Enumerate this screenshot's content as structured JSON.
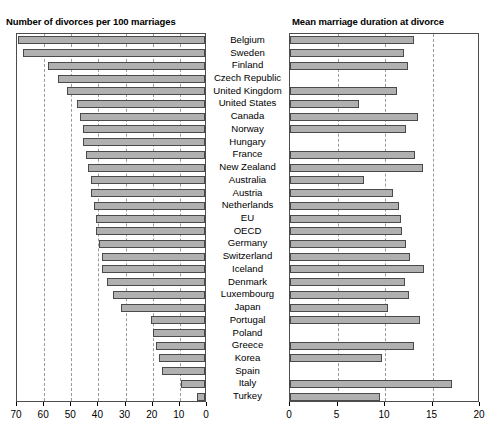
{
  "figure": {
    "countries": [
      "Belgium",
      "Sweden",
      "Finland",
      "Czech Republic",
      "United Kingdom",
      "United States",
      "Canada",
      "Norway",
      "Hungary",
      "France",
      "New Zealand",
      "Australia",
      "Austria",
      "Netherlands",
      "EU",
      "OECD",
      "Germany",
      "Switzerland",
      "Iceland",
      "Denmark",
      "Luxembourg",
      "Japan",
      "Portugal",
      "Poland",
      "Greece",
      "Korea",
      "Spain",
      "Italy",
      "Turkey"
    ]
  },
  "chart_data": [
    {
      "type": "bar",
      "orientation": "horizontal",
      "reversed_x": true,
      "title": "Number of divorces per 100 marriages",
      "xlabel": "",
      "ylabel": "",
      "xlim": [
        70,
        0
      ],
      "grid": true,
      "gridlines": [
        70,
        60,
        50,
        40,
        30,
        20,
        10,
        0
      ],
      "ticks": [
        "70",
        "60",
        "50",
        "40",
        "30",
        "20",
        "10",
        "0"
      ],
      "tick_values": [
        70,
        60,
        50,
        40,
        30,
        20,
        10,
        0
      ],
      "categories": [
        "Belgium",
        "Sweden",
        "Finland",
        "Czech Republic",
        "United Kingdom",
        "United States",
        "Canada",
        "Norway",
        "Hungary",
        "France",
        "New Zealand",
        "Australia",
        "Austria",
        "Netherlands",
        "EU",
        "OECD",
        "Germany",
        "Switzerland",
        "Iceland",
        "Denmark",
        "Luxembourg",
        "Japan",
        "Portugal",
        "Poland",
        "Greece",
        "Korea",
        "Spain",
        "Italy",
        "Turkey"
      ],
      "values": [
        69,
        67,
        58,
        54,
        51,
        47,
        46,
        46,
        46,
        45,
        45,
        44,
        43,
        42,
        42,
        41,
        40,
        40,
        39,
        38,
        38,
        36,
        34,
        31,
        29,
        25,
        20,
        19,
        19,
        17,
        17,
        16,
        9,
        3
      ],
      "bar_values": [
        69,
        67,
        58,
        54,
        51,
        47,
        46,
        45,
        45,
        44,
        43,
        42,
        42,
        41,
        40,
        40,
        39,
        38,
        38,
        36,
        34,
        31,
        20,
        19,
        18,
        17,
        16,
        9,
        3
      ]
    },
    {
      "type": "bar",
      "orientation": "horizontal",
      "reversed_x": false,
      "title": "Mean marriage duration at divorce",
      "xlabel": "",
      "ylabel": "",
      "xlim": [
        0,
        20
      ],
      "grid": true,
      "gridlines": [
        0,
        5,
        10,
        15,
        20
      ],
      "ticks": [
        "0",
        "5",
        "10",
        "15",
        "20"
      ],
      "tick_values": [
        0,
        5,
        10,
        15,
        20
      ],
      "categories": [
        "Belgium",
        "Sweden",
        "Finland",
        "Czech Republic",
        "United Kingdom",
        "United States",
        "Canada",
        "Norway",
        "Hungary",
        "France",
        "New Zealand",
        "Australia",
        "Austria",
        "Netherlands",
        "EU",
        "OECD",
        "Germany",
        "Switzerland",
        "Iceland",
        "Denmark",
        "Luxembourg",
        "Japan",
        "Portugal",
        "Poland",
        "Greece",
        "Korea",
        "Spain",
        "Italy",
        "Turkey"
      ],
      "bar_values": [
        13.1,
        12.0,
        12.4,
        null,
        11.3,
        7.3,
        13.5,
        12.2,
        null,
        13.2,
        14.0,
        7.8,
        10.8,
        11.5,
        11.7,
        11.8,
        12.2,
        12.6,
        14.1,
        12.1,
        12.5,
        10.3,
        13.7,
        null,
        13.0,
        9.7,
        null,
        17.1,
        9.5
      ]
    }
  ]
}
